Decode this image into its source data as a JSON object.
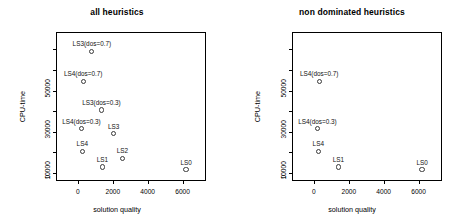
{
  "figure": {
    "background": "#ffffff",
    "marker_color": "#3a3a3a",
    "text_color": "#000000"
  },
  "chart_data": [
    {
      "type": "scatter",
      "title": "all heuristics",
      "xlabel": "solution quality",
      "ylabel": "CPU-time",
      "xlim": [
        -1200,
        7400
      ],
      "ylim": [
        -4500,
        68000
      ],
      "xticks": [
        0,
        2000,
        4000,
        6000
      ],
      "xticklabels": [
        "0",
        "2000",
        "4000",
        "6000"
      ],
      "yticks": [
        0,
        10000,
        30000,
        50000
      ],
      "yticklabels": [
        "0",
        "10000",
        "30000",
        "50000"
      ],
      "yticks_minor": [
        20000,
        40000,
        60000
      ],
      "grid": false,
      "legend": "none",
      "points": [
        {
          "label": "LS3(dos=0.7)",
          "x": 800,
          "y": 59000
        },
        {
          "label": "LS4(dos=0.7)",
          "x": 300,
          "y": 44500
        },
        {
          "label": "LS3(dos=0.3)",
          "x": 1350,
          "y": 30500
        },
        {
          "label": "LS4(dos=0.3)",
          "x": 200,
          "y": 21500
        },
        {
          "label": "LS3",
          "x": 2050,
          "y": 19000
        },
        {
          "label": "LS4",
          "x": 250,
          "y": 10500
        },
        {
          "label": "LS2",
          "x": 2550,
          "y": 7000
        },
        {
          "label": "LS1",
          "x": 1400,
          "y": 2800
        },
        {
          "label": "LS0",
          "x": 6200,
          "y": 1500
        }
      ]
    },
    {
      "type": "scatter",
      "title": "non dominated heuristics",
      "xlabel": "solution quality",
      "ylabel": "CPU-time",
      "xlim": [
        -1200,
        7400
      ],
      "ylim": [
        -4500,
        68000
      ],
      "xticks": [
        0,
        2000,
        4000,
        6000
      ],
      "xticklabels": [
        "0",
        "2000",
        "4000",
        "6000"
      ],
      "yticks": [
        0,
        10000,
        30000,
        50000
      ],
      "yticklabels": [
        "0",
        "10000",
        "30000",
        "50000"
      ],
      "yticks_minor": [
        20000,
        40000,
        60000
      ],
      "grid": false,
      "legend": "none",
      "points": [
        {
          "label": "LS4(dos=0.7)",
          "x": 300,
          "y": 44500
        },
        {
          "label": "LS4(dos=0.3)",
          "x": 200,
          "y": 21500
        },
        {
          "label": "LS4",
          "x": 250,
          "y": 10500
        },
        {
          "label": "LS1",
          "x": 1400,
          "y": 2800
        },
        {
          "label": "LS0",
          "x": 6200,
          "y": 1500
        }
      ]
    }
  ]
}
